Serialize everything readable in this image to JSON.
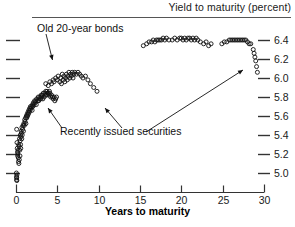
{
  "header": {
    "title": "Yield to maturity (percent)"
  },
  "annotations": [
    {
      "id": "old-bonds",
      "text": "Old 20-year bonds"
    },
    {
      "id": "recent",
      "text": "Recently issued securities"
    }
  ],
  "axis": {
    "x_title": "Years to maturity",
    "x_ticks": [
      "0",
      "5",
      "10",
      "15",
      "20",
      "25",
      "30"
    ],
    "y_ticks": [
      "6.4",
      "6.2",
      "6.0",
      "5.8",
      "5.6",
      "5.4",
      "5.2",
      "5.0"
    ]
  },
  "footer": {
    "source": ""
  },
  "colors": {
    "marker": "#111111",
    "axis": "#333333",
    "rule": "#555555",
    "background": "#ffffff"
  },
  "chart_data": {
    "type": "scatter",
    "title": "Yield to maturity (percent)",
    "xlabel": "Years to maturity",
    "ylabel": "Yield to maturity (percent)",
    "xlim": [
      0,
      30
    ],
    "ylim": [
      4.88,
      6.5
    ],
    "grid": false,
    "legend": null,
    "marker": "open-circle",
    "annotations": [
      {
        "text": "Old 20-year bonds",
        "points_to": [
          [
            5.1,
            6.03
          ],
          [
            5.6,
            5.82
          ]
        ]
      },
      {
        "text": "Recently issued securities",
        "points_to": [
          [
            4.4,
            5.84
          ],
          [
            8.6,
            5.96
          ],
          [
            28.6,
            6.18
          ]
        ]
      }
    ],
    "series": [
      {
        "name": "Treasury securities",
        "x": [
          0.08,
          0.12,
          0.15,
          0.18,
          0.2,
          0.22,
          0.25,
          0.28,
          0.3,
          0.32,
          0.35,
          0.38,
          0.4,
          0.42,
          0.45,
          0.48,
          0.5,
          0.52,
          0.55,
          0.58,
          0.6,
          0.62,
          0.65,
          0.7,
          0.72,
          0.75,
          0.8,
          0.85,
          0.9,
          0.95,
          1.0,
          1.05,
          1.1,
          1.15,
          1.2,
          1.25,
          1.3,
          1.35,
          1.4,
          1.45,
          1.5,
          1.55,
          1.6,
          1.65,
          1.7,
          1.75,
          1.8,
          1.9,
          1.95,
          2.0,
          2.05,
          2.1,
          2.2,
          2.25,
          2.3,
          2.4,
          2.45,
          2.5,
          2.6,
          2.7,
          2.75,
          2.8,
          2.9,
          3.0,
          3.05,
          3.1,
          3.2,
          3.25,
          3.3,
          3.4,
          3.5,
          3.55,
          3.6,
          3.7,
          3.75,
          3.8,
          3.9,
          4.0,
          4.05,
          4.1,
          4.2,
          4.3,
          4.4,
          4.5,
          4.6,
          4.7,
          4.8,
          4.9,
          3.6,
          3.9,
          4.1,
          4.3,
          4.5,
          4.6,
          4.8,
          5.0,
          5.1,
          5.3,
          5.4,
          5.5,
          5.6,
          5.7,
          5.8,
          5.9,
          6.0,
          6.1,
          6.2,
          6.3,
          6.4,
          6.5,
          6.6,
          6.7,
          6.8,
          6.9,
          7.0,
          7.1,
          7.3,
          7.5,
          7.7,
          7.9,
          8.1,
          8.4,
          8.7,
          9.0,
          9.4,
          9.8,
          15.4,
          15.8,
          16.1,
          16.4,
          16.6,
          16.8,
          17.0,
          17.2,
          17.4,
          17.6,
          17.8,
          18.0,
          18.2,
          18.5,
          18.9,
          19.2,
          19.5,
          19.8,
          20.0,
          20.2,
          20.4,
          20.6,
          20.8,
          21.0,
          21.2,
          21.4,
          21.6,
          21.8,
          22.0,
          22.3,
          22.7,
          23.0,
          23.3,
          23.6,
          24.9,
          25.2,
          25.5,
          25.8,
          26.0,
          26.2,
          26.4,
          26.6,
          26.8,
          27.0,
          27.2,
          27.4,
          27.6,
          27.8,
          28.0,
          28.2,
          28.4,
          28.7,
          28.8,
          28.9,
          29.0,
          29.1,
          29.2,
          0.05,
          0.06,
          0.07,
          0.09,
          0.1,
          0.11
        ],
        "y": [
          5.46,
          5.32,
          5.26,
          5.22,
          5.18,
          5.2,
          5.24,
          5.16,
          5.12,
          5.3,
          5.1,
          5.28,
          5.14,
          5.36,
          5.24,
          5.18,
          5.34,
          5.4,
          5.3,
          5.26,
          5.38,
          5.44,
          5.42,
          5.36,
          5.48,
          5.4,
          5.46,
          5.5,
          5.44,
          5.52,
          5.5,
          5.56,
          5.54,
          5.58,
          5.52,
          5.6,
          5.58,
          5.62,
          5.6,
          5.64,
          5.62,
          5.66,
          5.64,
          5.68,
          5.66,
          5.7,
          5.68,
          5.7,
          5.66,
          5.72,
          5.7,
          5.74,
          5.72,
          5.76,
          5.74,
          5.76,
          5.72,
          5.78,
          5.76,
          5.8,
          5.76,
          5.78,
          5.8,
          5.78,
          5.82,
          5.8,
          5.82,
          5.78,
          5.84,
          5.8,
          5.84,
          5.82,
          5.86,
          5.82,
          5.86,
          5.84,
          5.84,
          5.82,
          5.86,
          5.84,
          5.8,
          5.82,
          5.8,
          5.78,
          5.8,
          5.76,
          5.78,
          5.8,
          5.94,
          5.92,
          5.96,
          5.94,
          5.98,
          5.96,
          6.0,
          5.98,
          6.02,
          5.96,
          6.0,
          5.94,
          6.04,
          5.98,
          6.02,
          5.96,
          6.0,
          6.04,
          5.98,
          6.02,
          6.06,
          6.0,
          6.04,
          6.02,
          6.06,
          6.0,
          6.04,
          6.06,
          6.04,
          6.06,
          6.04,
          6.02,
          6.0,
          6.02,
          5.98,
          5.94,
          5.9,
          5.86,
          6.34,
          6.36,
          6.38,
          6.38,
          6.4,
          6.38,
          6.4,
          6.4,
          6.4,
          6.4,
          6.42,
          6.4,
          6.42,
          6.4,
          6.4,
          6.42,
          6.4,
          6.42,
          6.42,
          6.4,
          6.42,
          6.4,
          6.42,
          6.42,
          6.4,
          6.42,
          6.4,
          6.42,
          6.4,
          6.38,
          6.36,
          6.38,
          6.34,
          6.36,
          6.36,
          6.38,
          6.38,
          6.4,
          6.4,
          6.4,
          6.4,
          6.4,
          6.4,
          6.4,
          6.4,
          6.4,
          6.4,
          6.4,
          6.38,
          6.36,
          6.36,
          6.3,
          6.26,
          6.22,
          6.18,
          6.12,
          6.06,
          5.0,
          4.96,
          4.93,
          4.95,
          4.92,
          4.98
        ]
      }
    ]
  }
}
